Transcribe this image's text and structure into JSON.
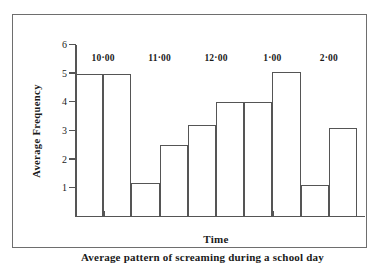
{
  "chart_data": {
    "type": "bar",
    "title": "",
    "caption": "Average pattern of screaming during a school day",
    "xlabel": "Time",
    "ylabel": "Average Frequency",
    "ylim": [
      0,
      6
    ],
    "yticks": [
      1,
      2,
      3,
      4,
      5,
      6
    ],
    "ytick_labels": [
      "1",
      "2",
      "3",
      "4",
      "5",
      "6"
    ],
    "grid": false,
    "legend": null,
    "xlim": [
      9.5,
      14.5
    ],
    "xticks": [
      10,
      11,
      12,
      13,
      14
    ],
    "xtick_labels": [
      "10·00",
      "11·00",
      "12·00",
      "1·00",
      "2·00"
    ],
    "bin_width": 0.5,
    "categories": [
      "9·30",
      "10·00",
      "10·30",
      "11·00",
      "11·30",
      "12·00",
      "12·30",
      "1·00",
      "1·30",
      "2·00"
    ],
    "bin_starts": [
      9.5,
      10.0,
      10.5,
      11.0,
      11.5,
      12.0,
      12.5,
      13.0,
      13.5,
      14.0
    ],
    "values": [
      5.0,
      5.0,
      1.2,
      2.5,
      3.2,
      4.0,
      4.0,
      5.05,
      1.1,
      3.1
    ]
  },
  "style": {
    "line_color": "#555555",
    "frame_color": "#6e6e6e",
    "background": "#ffffff"
  }
}
